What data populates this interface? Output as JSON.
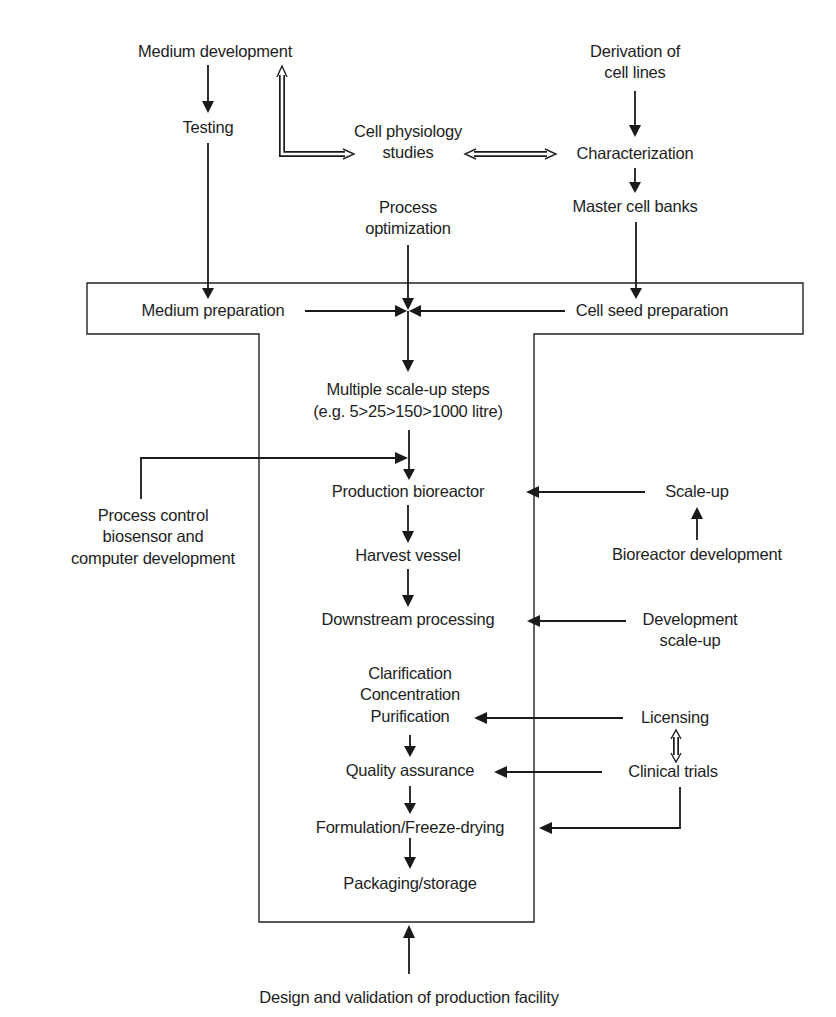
{
  "diagram": {
    "type": "process-flowchart",
    "colors": {
      "background": "#ffffff",
      "ink": "#1a1a1a"
    },
    "top_nodes": {
      "medium_development": "Medium development",
      "testing": "Testing",
      "cell_physiology_l1": "Cell physiology",
      "cell_physiology_l2": "studies",
      "derivation_l1": "Derivation of",
      "derivation_l2": "cell lines",
      "characterization": "Characterization",
      "master_cell_banks": "Master cell banks",
      "process_optimization_l1": "Process",
      "process_optimization_l2": "optimization"
    },
    "facility_nodes": {
      "medium_preparation": "Medium preparation",
      "cell_seed_preparation": "Cell seed preparation",
      "scale_up_steps_l1": "Multiple scale-up steps",
      "scale_up_steps_l2": "(e.g. 5>25>150>1000 litre)",
      "production_bioreactor": "Production bioreactor",
      "harvest_vessel": "Harvest vessel",
      "downstream_processing": "Downstream processing",
      "clarification": "Clarification",
      "concentration": "Concentration",
      "purification": "Purification",
      "quality_assurance": "Quality assurance",
      "formulation": "Formulation/Freeze-drying",
      "packaging": "Packaging/storage"
    },
    "side_nodes": {
      "process_control_l1": "Process control",
      "process_control_l2": "biosensor and",
      "process_control_l3": "computer development",
      "scale_up": "Scale-up",
      "bioreactor_development": "Bioreactor development",
      "development_scale_up_l1": "Development",
      "development_scale_up_l2": "scale-up",
      "licensing": "Licensing",
      "clinical_trials": "Clinical trials"
    },
    "bottom_node": {
      "design_validation": "Design and validation of production facility"
    },
    "edges": [
      [
        "Medium development",
        "Testing"
      ],
      [
        "Testing",
        "Medium preparation"
      ],
      [
        "Cell physiology studies",
        "Medium development",
        "double"
      ],
      [
        "Cell physiology studies",
        "Characterization",
        "double-bidirectional"
      ],
      [
        "Derivation of cell lines",
        "Characterization"
      ],
      [
        "Characterization",
        "Master cell banks"
      ],
      [
        "Master cell banks",
        "Cell seed preparation"
      ],
      [
        "Process optimization",
        "Multiple scale-up steps"
      ],
      [
        "Medium preparation",
        "Multiple scale-up steps"
      ],
      [
        "Cell seed preparation",
        "Multiple scale-up steps"
      ],
      [
        "Multiple scale-up steps",
        "Production bioreactor"
      ],
      [
        "Process control biosensor and computer development",
        "Production bioreactor"
      ],
      [
        "Scale-up",
        "Production bioreactor"
      ],
      [
        "Bioreactor development",
        "Scale-up"
      ],
      [
        "Production bioreactor",
        "Harvest vessel"
      ],
      [
        "Harvest vessel",
        "Downstream processing"
      ],
      [
        "Development scale-up",
        "Downstream processing"
      ],
      [
        "Licensing",
        "Purification"
      ],
      [
        "Licensing",
        "Clinical trials",
        "double-bidirectional"
      ],
      [
        "Clinical trials",
        "Quality assurance"
      ],
      [
        "Clinical trials",
        "Formulation/Freeze-drying"
      ],
      [
        "Purification",
        "Quality assurance"
      ],
      [
        "Quality assurance",
        "Formulation/Freeze-drying"
      ],
      [
        "Formulation/Freeze-drying",
        "Packaging/storage"
      ],
      [
        "Design and validation of production facility",
        "Production facility"
      ]
    ]
  }
}
